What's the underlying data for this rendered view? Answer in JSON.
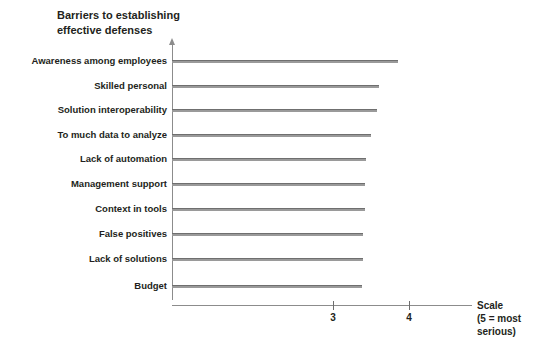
{
  "chart_data": {
    "type": "bar",
    "orientation": "horizontal",
    "title": "Barriers to establishing\neffective defenses",
    "xlabel": "Scale",
    "xlabel_note": "(5 = most serious)",
    "ylabel": "",
    "categories": [
      "Awareness among employees",
      "Skilled personal",
      "Solution interoperability",
      "To much data to analyze",
      "Lack of automation",
      "Management support",
      "Context in tools",
      "False positives",
      "Lack of solutions",
      "Budget"
    ],
    "values": [
      3.85,
      3.6,
      3.58,
      3.5,
      3.43,
      3.42,
      3.42,
      3.4,
      3.4,
      3.38
    ],
    "xticks": [
      3,
      4
    ],
    "xtick_labels": [
      "3",
      "4"
    ],
    "xlim": [
      2.05,
      4.95
    ],
    "grid": false,
    "legend": null,
    "bar_color": "#9a9a9a",
    "axis_color": "#8c8c8c",
    "text_color": "#231f20"
  },
  "axis": {
    "scale_label": "Scale",
    "scale_note": "(5 = most serious)",
    "scale_caption": "Scale\n(5 = most serious)"
  }
}
